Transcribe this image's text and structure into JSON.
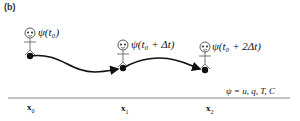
{
  "panel": {
    "label": "(b)"
  },
  "particles": [
    {
      "label": "ψ(t₀)",
      "x": 30,
      "y": 56
    },
    {
      "label": "ψ(t₀ + Δt)",
      "x": 123,
      "y": 68
    },
    {
      "label": "ψ(t₀ + 2Δt)",
      "x": 205,
      "y": 70
    }
  ],
  "axis": {
    "positions": [
      {
        "symbol": "x",
        "subscript": "0"
      },
      {
        "symbol": "x",
        "subscript": "1"
      },
      {
        "symbol": "x",
        "subscript": "2"
      }
    ]
  },
  "definition": "ψ = u, q, T, C",
  "colors": {
    "stroke": "#111111",
    "axis": "#888888"
  }
}
